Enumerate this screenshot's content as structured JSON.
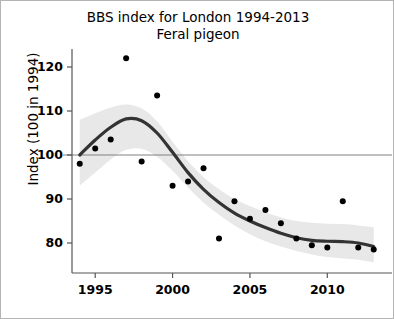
{
  "chart_data": {
    "type": "scatter",
    "title": "BBS index for London 1994-2013",
    "subtitle": "Feral pigeon",
    "xlabel": "",
    "ylabel": "Index (100 in 1994)",
    "xlim": [
      1993.5,
      2013.6
    ],
    "ylim": [
      75.5,
      123.5
    ],
    "xticks": [
      1995,
      2000,
      2005,
      2010
    ],
    "yticks": [
      80,
      90,
      100,
      110,
      120
    ],
    "grid": false,
    "legend": null,
    "reference_line": {
      "y": 100,
      "color": "#808080"
    },
    "x": [
      1994,
      1995,
      1996,
      1997,
      1998,
      1999,
      2000,
      2001,
      2002,
      2003,
      2004,
      2005,
      2006,
      2007,
      2008,
      2009,
      2010,
      2011,
      2012,
      2013
    ],
    "series": [
      {
        "name": "Annual index",
        "type": "scatter",
        "color": "#000000",
        "values": [
          98.0,
          101.5,
          103.5,
          122.0,
          98.5,
          113.5,
          93.0,
          94.0,
          97.0,
          81.0,
          89.5,
          85.5,
          87.5,
          84.5,
          81.0,
          79.5,
          79.0,
          89.5,
          79.0,
          78.5
        ]
      },
      {
        "name": "Smoothed trend",
        "type": "line",
        "color": "#333333",
        "values": [
          100.0,
          103.4,
          106.3,
          108.2,
          107.8,
          105.0,
          100.6,
          96.0,
          92.2,
          89.2,
          86.8,
          85.0,
          83.5,
          82.2,
          81.2,
          80.6,
          80.4,
          80.3,
          80.0,
          79.2
        ]
      },
      {
        "name": "Confidence band upper",
        "type": "band-upper",
        "color": "#e8e8e8",
        "values": [
          108.0,
          109.5,
          110.8,
          111.5,
          110.6,
          107.6,
          103.0,
          98.6,
          95.0,
          92.2,
          90.0,
          88.4,
          87.0,
          85.8,
          85.0,
          84.6,
          84.4,
          84.3,
          84.0,
          83.6
        ]
      },
      {
        "name": "Confidence band lower",
        "type": "band-lower",
        "color": "#e8e8e8",
        "values": [
          93.0,
          96.0,
          99.0,
          101.2,
          101.4,
          99.6,
          96.4,
          92.6,
          89.2,
          86.4,
          84.0,
          82.0,
          80.4,
          79.2,
          78.2,
          77.4,
          76.8,
          76.5,
          76.2,
          75.6
        ]
      }
    ]
  },
  "axis": {
    "ytick_labels": [
      "120",
      "110",
      "100",
      "90",
      "80"
    ],
    "xtick_labels": [
      "1995",
      "2000",
      "2005",
      "2010"
    ],
    "ylabel_text": "Index (100 in 1994)"
  },
  "title": {
    "line1": "BBS index for London 1994-2013",
    "line2": "Feral pigeon"
  }
}
